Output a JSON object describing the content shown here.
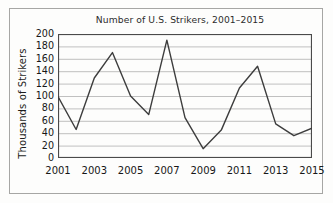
{
  "chart_data": {
    "type": "line",
    "title": "Number of U.S. Strikers, 2001–2015",
    "xlabel": "",
    "ylabel": "Thousands of Strikers",
    "x": [
      2001,
      2002,
      2003,
      2004,
      2005,
      2006,
      2007,
      2008,
      2009,
      2010,
      2011,
      2012,
      2013,
      2014,
      2015
    ],
    "values": [
      99,
      46,
      129,
      170,
      100,
      70,
      190,
      65,
      15,
      45,
      113,
      148,
      55,
      36,
      48
    ],
    "series": [
      {
        "name": "Thousands of Strikers",
        "values": [
          99,
          46,
          129,
          170,
          100,
          70,
          190,
          65,
          15,
          45,
          113,
          148,
          55,
          36,
          48
        ]
      }
    ],
    "xlim": [
      2001,
      2015
    ],
    "ylim": [
      0,
      200
    ],
    "ytick_labels": [
      "200",
      "180",
      "160",
      "140",
      "120",
      "100",
      "80",
      "60",
      "40",
      "20",
      "0"
    ],
    "ytick_values": [
      200,
      180,
      160,
      140,
      120,
      100,
      80,
      60,
      40,
      20,
      0
    ],
    "xtick_labels": [
      "2001",
      "2003",
      "2005",
      "2007",
      "2009",
      "2011",
      "2013",
      "2015"
    ],
    "xtick_values": [
      2001,
      2003,
      2005,
      2007,
      2009,
      2011,
      2013,
      2015
    ],
    "xtick_minor_values": [
      2002,
      2004,
      2006,
      2008,
      2010,
      2012,
      2014
    ],
    "grid": "horizontal",
    "legend": "none",
    "line_color": "#3d3d3d",
    "grid_color": "#b9b9b9",
    "axis_color": "#4a4a4a",
    "background_color": "#fdfdfc"
  }
}
